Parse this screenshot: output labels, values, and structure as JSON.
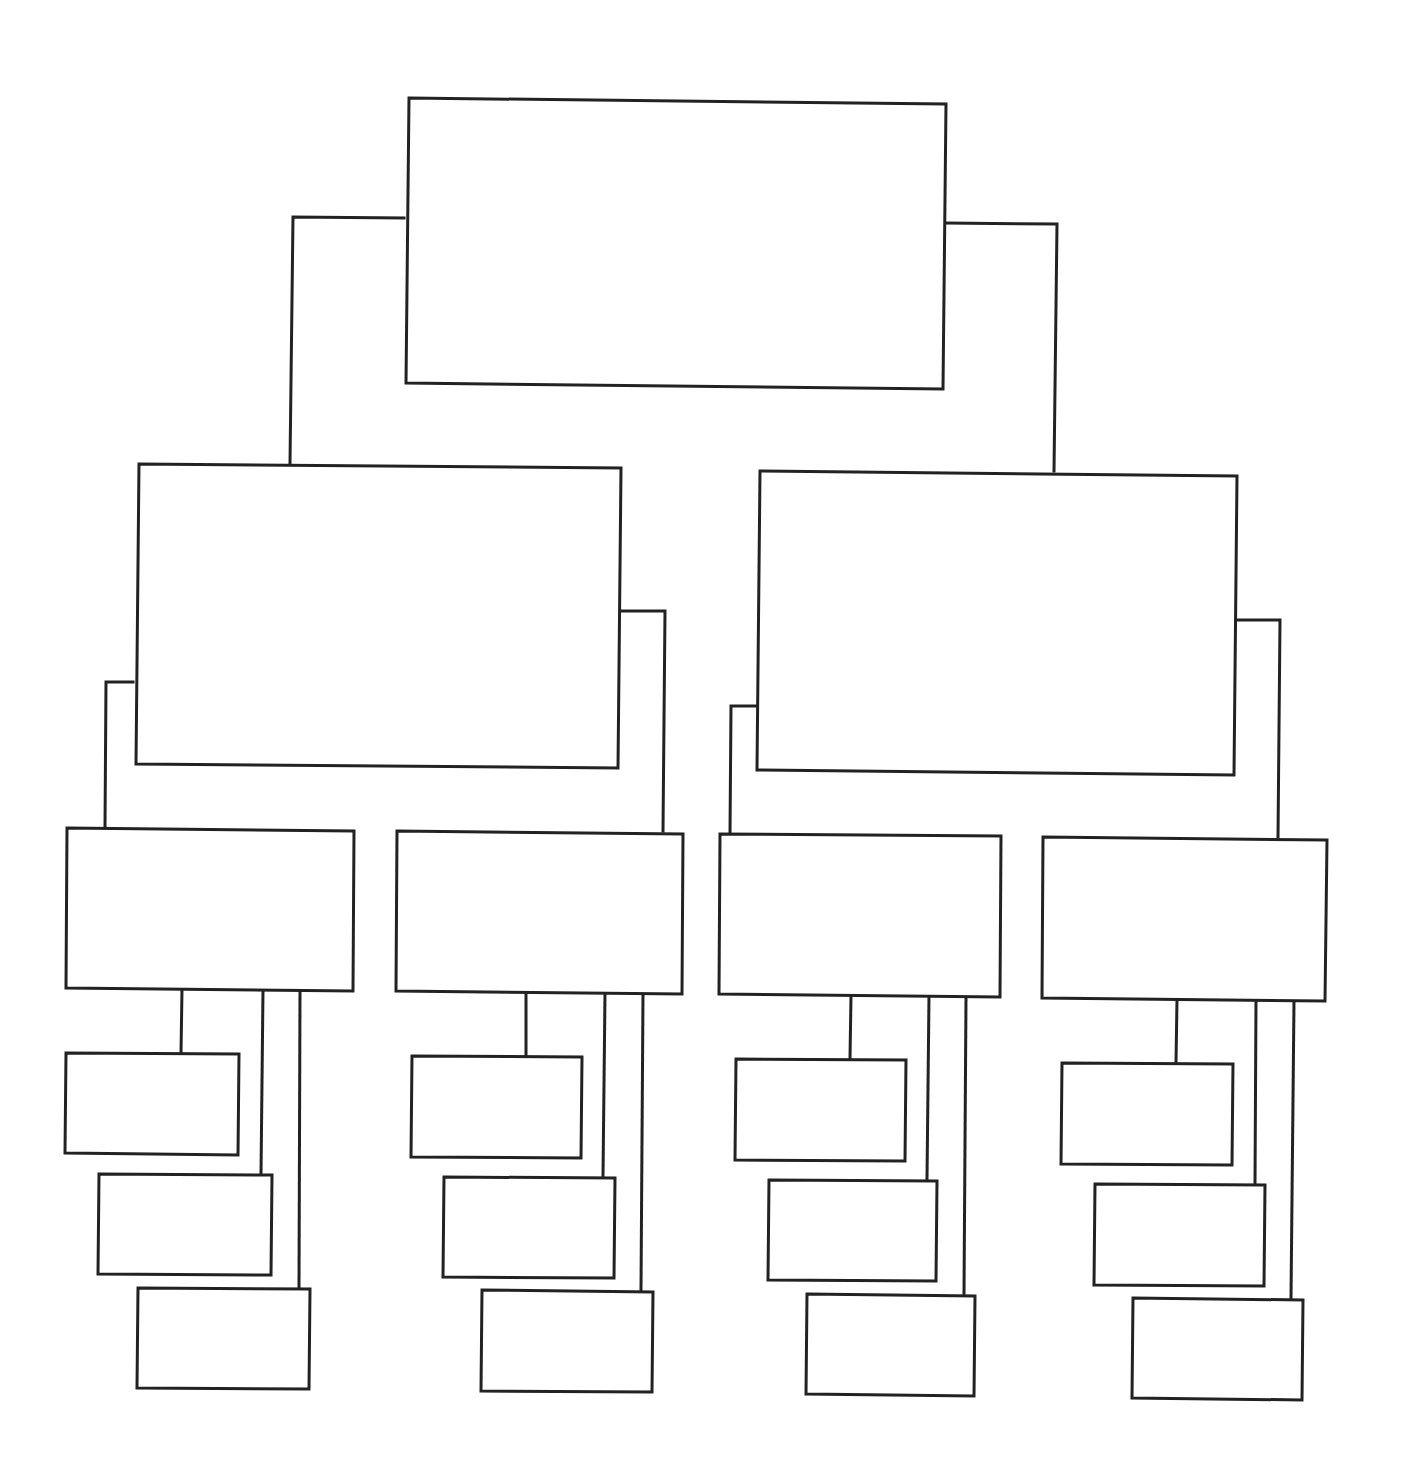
{
  "diagram": {
    "type": "tree",
    "stroke_color": "#222222",
    "background": "#ffffff",
    "levels": 4,
    "nodes": [
      {
        "id": "root",
        "level": 1,
        "label": "",
        "points": [
          [
            409,
            98
          ],
          [
            946,
            104
          ],
          [
            943,
            389
          ],
          [
            406,
            383
          ]
        ]
      },
      {
        "id": "l2-left",
        "level": 2,
        "label": "",
        "parent": "root",
        "points": [
          [
            139,
            464
          ],
          [
            621,
            468
          ],
          [
            618,
            768
          ],
          [
            136,
            764
          ]
        ]
      },
      {
        "id": "l2-right",
        "level": 2,
        "label": "",
        "parent": "root",
        "points": [
          [
            760,
            471
          ],
          [
            1237,
            476
          ],
          [
            1234,
            775
          ],
          [
            757,
            770
          ]
        ]
      },
      {
        "id": "l3-1",
        "level": 3,
        "label": "",
        "parent": "l2-left",
        "points": [
          [
            67,
            828
          ],
          [
            354,
            831
          ],
          [
            353,
            991
          ],
          [
            66,
            988
          ]
        ]
      },
      {
        "id": "l3-2",
        "level": 3,
        "label": "",
        "parent": "l2-left",
        "points": [
          [
            397,
            831
          ],
          [
            683,
            834
          ],
          [
            682,
            994
          ],
          [
            396,
            991
          ]
        ]
      },
      {
        "id": "l3-3",
        "level": 3,
        "label": "",
        "parent": "l2-right",
        "points": [
          [
            720,
            834
          ],
          [
            1001,
            836
          ],
          [
            1000,
            997
          ],
          [
            719,
            994
          ]
        ]
      },
      {
        "id": "l3-4",
        "level": 3,
        "label": "",
        "parent": "l2-right",
        "points": [
          [
            1043,
            837
          ],
          [
            1327,
            840
          ],
          [
            1325,
            1001
          ],
          [
            1042,
            998
          ]
        ]
      },
      {
        "id": "leaf-1-1",
        "level": 4,
        "label": "",
        "parent": "l3-1",
        "points": [
          [
            66,
            1053
          ],
          [
            239,
            1054
          ],
          [
            238,
            1155
          ],
          [
            65,
            1153
          ]
        ]
      },
      {
        "id": "leaf-1-2",
        "level": 4,
        "label": "",
        "parent": "l3-1",
        "points": [
          [
            99,
            1174
          ],
          [
            272,
            1175
          ],
          [
            271,
            1275
          ],
          [
            98,
            1274
          ]
        ]
      },
      {
        "id": "leaf-1-3",
        "level": 4,
        "label": "",
        "parent": "l3-1",
        "points": [
          [
            138,
            1288
          ],
          [
            310,
            1289
          ],
          [
            309,
            1389
          ],
          [
            137,
            1388
          ]
        ]
      },
      {
        "id": "leaf-2-1",
        "level": 4,
        "label": "",
        "parent": "l3-2",
        "points": [
          [
            412,
            1056
          ],
          [
            582,
            1057
          ],
          [
            581,
            1158
          ],
          [
            411,
            1157
          ]
        ]
      },
      {
        "id": "leaf-2-2",
        "level": 4,
        "label": "",
        "parent": "l3-2",
        "points": [
          [
            444,
            1177
          ],
          [
            615,
            1178
          ],
          [
            614,
            1278
          ],
          [
            443,
            1277
          ]
        ]
      },
      {
        "id": "leaf-2-3",
        "level": 4,
        "label": "",
        "parent": "l3-2",
        "points": [
          [
            482,
            1290
          ],
          [
            653,
            1292
          ],
          [
            652,
            1392
          ],
          [
            481,
            1391
          ]
        ]
      },
      {
        "id": "leaf-3-1",
        "level": 4,
        "label": "",
        "parent": "l3-3",
        "points": [
          [
            736,
            1059
          ],
          [
            906,
            1060
          ],
          [
            905,
            1161
          ],
          [
            735,
            1160
          ]
        ]
      },
      {
        "id": "leaf-3-2",
        "level": 4,
        "label": "",
        "parent": "l3-3",
        "points": [
          [
            769,
            1180
          ],
          [
            937,
            1181
          ],
          [
            936,
            1281
          ],
          [
            768,
            1280
          ]
        ]
      },
      {
        "id": "leaf-3-3",
        "level": 4,
        "label": "",
        "parent": "l3-3",
        "points": [
          [
            807,
            1294
          ],
          [
            975,
            1296
          ],
          [
            974,
            1396
          ],
          [
            806,
            1394
          ]
        ]
      },
      {
        "id": "leaf-4-1",
        "level": 4,
        "label": "",
        "parent": "l3-4",
        "points": [
          [
            1062,
            1063
          ],
          [
            1233,
            1064
          ],
          [
            1232,
            1165
          ],
          [
            1061,
            1164
          ]
        ]
      },
      {
        "id": "leaf-4-2",
        "level": 4,
        "label": "",
        "parent": "l3-4",
        "points": [
          [
            1095,
            1184
          ],
          [
            1265,
            1185
          ],
          [
            1264,
            1286
          ],
          [
            1094,
            1285
          ]
        ]
      },
      {
        "id": "leaf-4-3",
        "level": 4,
        "label": "",
        "parent": "l3-4",
        "points": [
          [
            1133,
            1298
          ],
          [
            1303,
            1300
          ],
          [
            1302,
            1400
          ],
          [
            1132,
            1398
          ]
        ]
      }
    ],
    "connectors": [
      {
        "id": "root-to-l2-left",
        "points": [
          [
            404,
            218
          ],
          [
            293,
            217
          ],
          [
            290,
            464
          ]
        ]
      },
      {
        "id": "root-to-l2-right",
        "points": [
          [
            945,
            223
          ],
          [
            1057,
            224
          ],
          [
            1054,
            471
          ]
        ]
      },
      {
        "id": "l2-left-to-l3-1",
        "points": [
          [
            133,
            682
          ],
          [
            106,
            682
          ],
          [
            105,
            828
          ]
        ]
      },
      {
        "id": "l2-left-to-l3-2",
        "points": [
          [
            617,
            611
          ],
          [
            665,
            611
          ],
          [
            663,
            831
          ]
        ]
      },
      {
        "id": "l2-right-to-l3-3",
        "points": [
          [
            756,
            706
          ],
          [
            731,
            706
          ],
          [
            730,
            834
          ]
        ]
      },
      {
        "id": "l2-right-to-l3-4",
        "points": [
          [
            1234,
            620
          ],
          [
            1280,
            620
          ],
          [
            1278,
            837
          ]
        ]
      },
      {
        "id": "l3-1-to-leaf-1-1",
        "points": [
          [
            182,
            989
          ],
          [
            181,
            1053
          ]
        ]
      },
      {
        "id": "l3-1-to-leaf-1-2",
        "points": [
          [
            263,
            990
          ],
          [
            261,
            1174
          ]
        ]
      },
      {
        "id": "l3-1-to-leaf-1-3",
        "points": [
          [
            300,
            991
          ],
          [
            299,
            1288
          ]
        ]
      },
      {
        "id": "l3-2-to-leaf-2-1",
        "points": [
          [
            526,
            992
          ],
          [
            526,
            1056
          ]
        ]
      },
      {
        "id": "l3-2-to-leaf-2-2",
        "points": [
          [
            605,
            993
          ],
          [
            603,
            1177
          ]
        ]
      },
      {
        "id": "l3-2-to-leaf-2-3",
        "points": [
          [
            643,
            994
          ],
          [
            641,
            1290
          ]
        ]
      },
      {
        "id": "l3-3-to-leaf-3-1",
        "points": [
          [
            851,
            996
          ],
          [
            850,
            1059
          ]
        ]
      },
      {
        "id": "l3-3-to-leaf-3-2",
        "points": [
          [
            929,
            996
          ],
          [
            927,
            1180
          ]
        ]
      },
      {
        "id": "l3-3-to-leaf-3-3",
        "points": [
          [
            966,
            997
          ],
          [
            964,
            1294
          ]
        ]
      },
      {
        "id": "l3-4-to-leaf-4-1",
        "points": [
          [
            1177,
            999
          ],
          [
            1176,
            1063
          ]
        ]
      },
      {
        "id": "l3-4-to-leaf-4-2",
        "points": [
          [
            1256,
            1000
          ],
          [
            1255,
            1184
          ]
        ]
      },
      {
        "id": "l3-4-to-leaf-4-3",
        "points": [
          [
            1294,
            1001
          ],
          [
            1291,
            1298
          ]
        ]
      }
    ]
  }
}
